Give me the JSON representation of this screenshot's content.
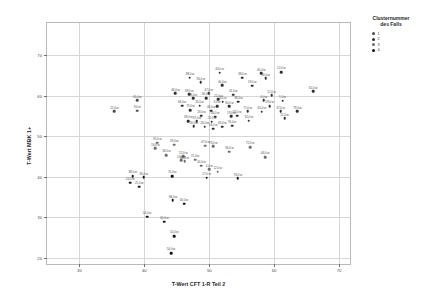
{
  "chart_data": {
    "type": "scatter",
    "title": "",
    "xlabel": "T-Wert CFT 1-R Teil 2",
    "ylabel": "T-Wert MBK 1+",
    "xlim": [
      25,
      72
    ],
    "ylim": [
      18,
      78
    ],
    "grid": true,
    "legend_position": "top-right",
    "xticks": [
      "30",
      "40",
      "50",
      "60",
      "70"
    ],
    "xtick_values": [
      30,
      40,
      50,
      60,
      70
    ],
    "yticks": [
      "20",
      "30",
      "40",
      "50",
      "60",
      "70"
    ],
    "ytick_values": [
      20,
      30,
      40,
      50,
      60,
      70
    ],
    "legend": {
      "title_line1": "Clusternummer",
      "title_line2": "des Falls",
      "entries": [
        {
          "label": "1",
          "cluster": 1,
          "color": "#4d4d4d"
        },
        {
          "label": "2",
          "cluster": 2,
          "color": "#2e2e2e"
        },
        {
          "label": "3",
          "cluster": 3,
          "color": "#6b6b6b"
        },
        {
          "label": "4",
          "cluster": 4,
          "color": "#151515"
        }
      ]
    },
    "points": [
      {
        "x": 35.4,
        "y": 56.2,
        "cluster": 1,
        "label": "22,0:w"
      },
      {
        "x": 38.9,
        "y": 58.9,
        "cluster": 1,
        "label": "45,0:w"
      },
      {
        "x": 38.9,
        "y": 56.3,
        "cluster": 1,
        "label": "9,0:w"
      },
      {
        "x": 38.2,
        "y": 40.2,
        "cluster": 4,
        "label": "38,0:w"
      },
      {
        "x": 37.8,
        "y": 38.6,
        "cluster": 4,
        "label": "24,0:w"
      },
      {
        "x": 39.9,
        "y": 39.9,
        "cluster": 4,
        "label": "36,0:w"
      },
      {
        "x": 39.2,
        "y": 37.6,
        "cluster": 4,
        "label": "21,0:w"
      },
      {
        "x": 40.4,
        "y": 30.2,
        "cluster": 4,
        "label": "14,0:w"
      },
      {
        "x": 43.1,
        "y": 28.9,
        "cluster": 4,
        "label": "60,0:w"
      },
      {
        "x": 44.4,
        "y": 34.2,
        "cluster": 4,
        "label": "68,0:w"
      },
      {
        "x": 46.1,
        "y": 33.4,
        "cluster": 4,
        "label": "40,0:w"
      },
      {
        "x": 44.6,
        "y": 25.4,
        "cluster": 4,
        "label": "10,0:w"
      },
      {
        "x": 44.1,
        "y": 21.2,
        "cluster": 4,
        "label": "54,0:w"
      },
      {
        "x": 44.3,
        "y": 40.2,
        "cluster": 4,
        "label": "70,0:w"
      },
      {
        "x": 49.6,
        "y": 39.8,
        "cluster": 4,
        "label": "27,0:w"
      },
      {
        "x": 54.4,
        "y": 39.7,
        "cluster": 4,
        "label": "76,0:w"
      },
      {
        "x": 42.0,
        "y": 48.4,
        "cluster": 3,
        "label": "35,0:w"
      },
      {
        "x": 41.7,
        "y": 47.1,
        "cluster": 3,
        "label": "16,0:w"
      },
      {
        "x": 44.6,
        "y": 47.9,
        "cluster": 3,
        "label": "29,0:w"
      },
      {
        "x": 43.4,
        "y": 45.4,
        "cluster": 3,
        "label": "58,0:w"
      },
      {
        "x": 46.0,
        "y": 45.1,
        "cluster": 3,
        "label": "52,0:w"
      },
      {
        "x": 46.2,
        "y": 43.9,
        "cluster": 3,
        "label": "66,0:w"
      },
      {
        "x": 45.7,
        "y": 44.1,
        "cluster": 3,
        "label": "14,0:w"
      },
      {
        "x": 47.8,
        "y": 44.2,
        "cluster": 3,
        "label": "72,0:w"
      },
      {
        "x": 49.4,
        "y": 47.7,
        "cluster": 3,
        "label": "47,0:w"
      },
      {
        "x": 50.6,
        "y": 47.6,
        "cluster": 3,
        "label": "73,0:w"
      },
      {
        "x": 48.8,
        "y": 42.8,
        "cluster": 3,
        "label": "40,0:w"
      },
      {
        "x": 50.0,
        "y": 41.9,
        "cluster": 3,
        "label": "4,0:w"
      },
      {
        "x": 51.3,
        "y": 41.3,
        "cluster": 3,
        "label": "12,0:w"
      },
      {
        "x": 53.1,
        "y": 46.2,
        "cluster": 3,
        "label": "36,0:w"
      },
      {
        "x": 56.3,
        "y": 47.4,
        "cluster": 3,
        "label": "72,0:w"
      },
      {
        "x": 58.6,
        "y": 44.9,
        "cluster": 3,
        "label": "46,0:w"
      },
      {
        "x": 44.8,
        "y": 60.6,
        "cluster": 2,
        "label": "46,0:w"
      },
      {
        "x": 46.9,
        "y": 60.4,
        "cluster": 2,
        "label": "39,0:w"
      },
      {
        "x": 49.9,
        "y": 60.6,
        "cluster": 2,
        "label": "47,0:w"
      },
      {
        "x": 53.7,
        "y": 60.3,
        "cluster": 2,
        "label": "41,0:w"
      },
      {
        "x": 47.5,
        "y": 59.4,
        "cluster": 2,
        "label": "78,0:w"
      },
      {
        "x": 49.5,
        "y": 59.5,
        "cluster": 2,
        "label": "56,0:w"
      },
      {
        "x": 51.4,
        "y": 59.2,
        "cluster": 2,
        "label": "21,0:w"
      },
      {
        "x": 52.1,
        "y": 58.6,
        "cluster": 2,
        "label": "6,0:w"
      },
      {
        "x": 54.5,
        "y": 58.6,
        "cluster": 2,
        "label": "38,0:w"
      },
      {
        "x": 48.7,
        "y": 63.4,
        "cluster": 2,
        "label": "36,0:w"
      },
      {
        "x": 52.0,
        "y": 62.6,
        "cluster": 2,
        "label": "40,0:w"
      },
      {
        "x": 45.8,
        "y": 57.6,
        "cluster": 2,
        "label": "34,0:w"
      },
      {
        "x": 48.5,
        "y": 57.6,
        "cluster": 2,
        "label": "35,0:w"
      },
      {
        "x": 51.2,
        "y": 57.5,
        "cluster": 2,
        "label": "3,0:w"
      },
      {
        "x": 47.1,
        "y": 56.5,
        "cluster": 2,
        "label": "73,0:w"
      },
      {
        "x": 50.3,
        "y": 56.3,
        "cluster": 2,
        "label": "43,0:w"
      },
      {
        "x": 48.8,
        "y": 55.1,
        "cluster": 2,
        "label": "23,0:w"
      },
      {
        "x": 50.9,
        "y": 54.9,
        "cluster": 2,
        "label": "66,0:w"
      },
      {
        "x": 46.8,
        "y": 53.8,
        "cluster": 2,
        "label": "69,0:w"
      },
      {
        "x": 48.1,
        "y": 53.7,
        "cluster": 2,
        "label": "37,0:w"
      },
      {
        "x": 50.4,
        "y": 53.6,
        "cluster": 2,
        "label": "22,0:w"
      },
      {
        "x": 47.6,
        "y": 52.5,
        "cluster": 2,
        "label": "16,0:w"
      },
      {
        "x": 49.3,
        "y": 52.4,
        "cluster": 2,
        "label": "26,0:w"
      },
      {
        "x": 50.6,
        "y": 51.9,
        "cluster": 2,
        "label": "54,0:w"
      },
      {
        "x": 52.0,
        "y": 52.4,
        "cluster": 2,
        "label": "63,0:w"
      },
      {
        "x": 53.5,
        "y": 52.6,
        "cluster": 2,
        "label": "76,0:w"
      },
      {
        "x": 53.4,
        "y": 55.0,
        "cluster": 2,
        "label": "19,0:w"
      },
      {
        "x": 54.3,
        "y": 55.1,
        "cluster": 2,
        "label": "26,0:w"
      },
      {
        "x": 55.9,
        "y": 56.2,
        "cluster": 2,
        "label": "71,0:w"
      },
      {
        "x": 56.1,
        "y": 53.9,
        "cluster": 2,
        "label": "32,0:w"
      },
      {
        "x": 53.1,
        "y": 57.4,
        "cluster": 2,
        "label": "30,0:w"
      },
      {
        "x": 51.6,
        "y": 65.7,
        "cluster": 2,
        "label": "44,0:w"
      },
      {
        "x": 55.1,
        "y": 64.5,
        "cluster": 2,
        "label": "38,0:w"
      },
      {
        "x": 47.0,
        "y": 64.5,
        "cluster": 2,
        "label": "38,0:w"
      },
      {
        "x": 58.0,
        "y": 65.6,
        "cluster": 2,
        "label": "45,0:w"
      },
      {
        "x": 61.1,
        "y": 65.9,
        "cluster": 2,
        "label": "12,0:w"
      },
      {
        "x": 58.7,
        "y": 64.3,
        "cluster": 2,
        "label": "60,0:w"
      },
      {
        "x": 56.6,
        "y": 62.5,
        "cluster": 2,
        "label": "19,0:w"
      },
      {
        "x": 66.0,
        "y": 61.1,
        "cluster": 2,
        "label": "62,0:w"
      },
      {
        "x": 59.6,
        "y": 60.1,
        "cluster": 2,
        "label": "51,0:w"
      },
      {
        "x": 58.4,
        "y": 58.9,
        "cluster": 2,
        "label": "4,0:w"
      },
      {
        "x": 61.3,
        "y": 58.8,
        "cluster": 2,
        "label": "1,0:w"
      },
      {
        "x": 59.3,
        "y": 57.5,
        "cluster": 2,
        "label": "59,0:w"
      },
      {
        "x": 58.1,
        "y": 56.1,
        "cluster": 2,
        "label": "65,0:w"
      },
      {
        "x": 61.0,
        "y": 56.2,
        "cluster": 2,
        "label": "37,0:w"
      },
      {
        "x": 63.6,
        "y": 56.2,
        "cluster": 2,
        "label": "79,0:w"
      },
      {
        "x": 61.6,
        "y": 54.5,
        "cluster": 2,
        "label": "11,0:w"
      }
    ]
  }
}
